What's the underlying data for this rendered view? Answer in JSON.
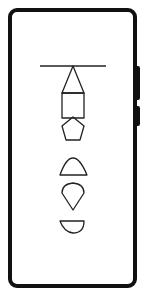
{
  "device": {
    "type": "phone-outline",
    "frame_color": "#111111",
    "screen_color": "#ffffff"
  },
  "diagram": {
    "stroke_color": "#222222",
    "shapes": [
      {
        "name": "horizontal-line",
        "kind": "line"
      },
      {
        "name": "triangle",
        "kind": "polygon"
      },
      {
        "name": "square",
        "kind": "rect"
      },
      {
        "name": "pentagon",
        "kind": "polygon"
      },
      {
        "name": "dome",
        "kind": "half-ellipse-up"
      },
      {
        "name": "teardrop",
        "kind": "inverted-drop"
      },
      {
        "name": "half-disc",
        "kind": "half-ellipse-down"
      }
    ]
  }
}
